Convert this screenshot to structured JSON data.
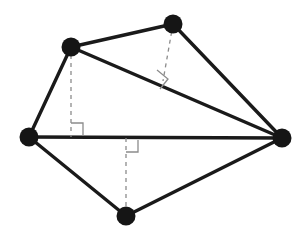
{
  "figure": {
    "background_color": "#ffffff",
    "edge_color": "#1a1a1a",
    "dash_color": "#8c8c8c",
    "vertex_color": "#151515",
    "width": 307,
    "height": 239
  },
  "vertices": [
    {
      "id": "top",
      "name": "top-vertex",
      "x": 173,
      "y": 24,
      "radius": 9.5
    },
    {
      "id": "upper_left",
      "name": "upper-left-vertex",
      "x": 71,
      "y": 47,
      "radius": 9.5
    },
    {
      "id": "left",
      "name": "left-vertex",
      "x": 29,
      "y": 137,
      "radius": 9.5
    },
    {
      "id": "bottom",
      "name": "bottom-vertex",
      "x": 126,
      "y": 216,
      "radius": 9.5
    },
    {
      "id": "right",
      "name": "right-vertex",
      "x": 282,
      "y": 138,
      "radius": 9.5
    }
  ],
  "solid_edges": [
    {
      "id": "edge_ul_top",
      "name": "edge-upperleft-to-top",
      "x1": 71,
      "y1": 47,
      "x2": 173,
      "y2": 24
    },
    {
      "id": "edge_top_right",
      "name": "edge-top-to-right",
      "x1": 173,
      "y1": 24,
      "x2": 282,
      "y2": 138
    },
    {
      "id": "edge_right_bot",
      "name": "edge-right-to-bottom",
      "x1": 282,
      "y1": 138,
      "x2": 126,
      "y2": 216
    },
    {
      "id": "edge_bot_left",
      "name": "edge-bottom-to-left",
      "x1": 126,
      "y1": 216,
      "x2": 29,
      "y2": 137
    },
    {
      "id": "edge_left_ul",
      "name": "edge-left-to-upperleft",
      "x1": 29,
      "y1": 137,
      "x2": 71,
      "y2": 47
    },
    {
      "id": "diag_left_right",
      "name": "diagonal-left-to-right",
      "x1": 29,
      "y1": 137,
      "x2": 282,
      "y2": 138
    },
    {
      "id": "diag_ul_right",
      "name": "diagonal-upperleft-to-right",
      "x1": 71,
      "y1": 47,
      "x2": 282,
      "y2": 138
    }
  ],
  "dashed_segments": [
    {
      "id": "alt_ul",
      "name": "altitude-upperleft-to-baseline",
      "x1": 71,
      "y1": 47,
      "x2": 71,
      "y2": 137
    },
    {
      "id": "alt_top",
      "name": "altitude-top-to-diagonal",
      "x1": 173,
      "y1": 24,
      "x2": 163,
      "y2": 81
    },
    {
      "id": "alt_bot",
      "name": "altitude-baseline-to-bottom",
      "x1": 126,
      "y1": 138,
      "x2": 126,
      "y2": 216
    }
  ],
  "right_angle_marks": [
    {
      "id": "mark_ul",
      "name": "right-angle-mark-upperleft",
      "points": "71,123 83,123 83,136"
    },
    {
      "id": "mark_top",
      "name": "right-angle-mark-top",
      "points": "157,70 168,79 160,89"
    },
    {
      "id": "mark_bot",
      "name": "right-angle-mark-bottom",
      "points": "126,152 138,152 138,140"
    }
  ]
}
